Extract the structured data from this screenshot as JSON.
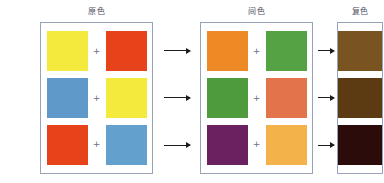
{
  "diagram": {
    "title_stage_primary": "原色",
    "title_stage_secondary": "间色",
    "title_stage_tertiary": "复色",
    "plus_symbol": "+",
    "arrow_icon": "right-arrow"
  },
  "chart_data": {
    "type": "table",
    "stages": [
      "原色",
      "间色",
      "复色"
    ],
    "columns": [
      "原色 A",
      "原色 B",
      "间色 A",
      "间色 B",
      "复色"
    ],
    "rows": [
      {
        "primary_a": {
          "name": "yellow",
          "hex": "#F4EA3E"
        },
        "primary_b": {
          "name": "red",
          "hex": "#E7431B"
        },
        "secondary_a": {
          "name": "orange",
          "hex": "#EE8A26"
        },
        "secondary_b": {
          "name": "green",
          "hex": "#55A245"
        },
        "tertiary": {
          "name": "olive-brown",
          "hex": "#7A5420"
        }
      },
      {
        "primary_a": {
          "name": "blue",
          "hex": "#5E99C9"
        },
        "primary_b": {
          "name": "yellow",
          "hex": "#F4EA3E"
        },
        "secondary_a": {
          "name": "green",
          "hex": "#4E9B3E"
        },
        "secondary_b": {
          "name": "salmon-orange",
          "hex": "#E2734A"
        },
        "tertiary": {
          "name": "dark-brown",
          "hex": "#5C3A12"
        }
      },
      {
        "primary_a": {
          "name": "red",
          "hex": "#E7431B"
        },
        "primary_b": {
          "name": "blue",
          "hex": "#64A0CE"
        },
        "secondary_a": {
          "name": "purple",
          "hex": "#6B2060"
        },
        "secondary_b": {
          "name": "amber",
          "hex": "#F4B24A"
        },
        "tertiary": {
          "name": "near-black-maroon",
          "hex": "#2B0C0A"
        }
      }
    ]
  }
}
